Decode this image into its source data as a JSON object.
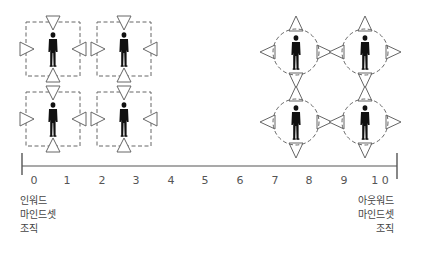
{
  "diagram": {
    "title": "",
    "axis": {
      "min": 0,
      "max": 10,
      "ticks": [
        "0",
        "1",
        "2",
        "3",
        "4",
        "5",
        "6",
        "7",
        "8",
        "9",
        "1 0"
      ],
      "color": "#555555"
    },
    "left_caption": {
      "lines": [
        "인워드",
        "마인드셋",
        "조직"
      ]
    },
    "right_caption": {
      "lines": [
        "아웃워드",
        "마인드셋",
        "조직"
      ]
    },
    "inward_group": {
      "shape": "dashed-square",
      "triangle_direction": "inward",
      "figures": [
        {
          "cx": 53,
          "cy": 49
        },
        {
          "cx": 124,
          "cy": 49
        },
        {
          "cx": 53,
          "cy": 119
        },
        {
          "cx": 124,
          "cy": 119
        }
      ]
    },
    "outward_group": {
      "shape": "dashed-circle",
      "triangle_direction": "outward",
      "figures": [
        {
          "cx": 296,
          "cy": 52
        },
        {
          "cx": 365,
          "cy": 52
        },
        {
          "cx": 296,
          "cy": 122
        },
        {
          "cx": 365,
          "cy": 122
        }
      ]
    },
    "colors": {
      "stroke": "#666666",
      "figure": "#111111"
    }
  }
}
